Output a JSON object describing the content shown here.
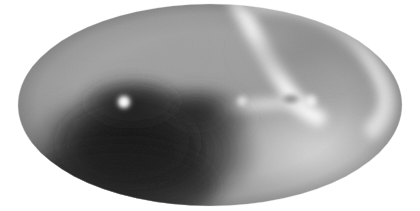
{
  "figure": {
    "name": "all-sky-map",
    "title": "",
    "background_color": "#ffffff",
    "width": 420,
    "height": 211,
    "colormap": "grayscale",
    "projection": "mollweide-ellipse"
  },
  "chart_data": {
    "type": "heatmap",
    "title": "",
    "subtitle": "",
    "xlabel": "",
    "ylabel": "",
    "legend": [],
    "annotations": [],
    "grid": false,
    "colorbar": false,
    "colormap": "grayscale",
    "colormap_stops": [
      {
        "value": 0.0,
        "hex": "#1f1f1f"
      },
      {
        "value": 0.2,
        "hex": "#3d3d3d"
      },
      {
        "value": 0.4,
        "hex": "#6e6e6e"
      },
      {
        "value": 0.6,
        "hex": "#9a9a9a"
      },
      {
        "value": 0.8,
        "hex": "#c6c6c6"
      },
      {
        "value": 1.0,
        "hex": "#f2f2f2"
      }
    ],
    "projection": {
      "shape": "ellipse",
      "center_x": 210,
      "center_y": 105,
      "radius_x": 192,
      "radius_y": 101
    },
    "xlim": [
      18,
      402
    ],
    "ylim": [
      4,
      206
    ],
    "features": [
      {
        "name": "dark-lobe-lower-left",
        "kind": "blob",
        "cx": 140,
        "cy": 150,
        "rx": 118,
        "ry": 72,
        "level": 0.06,
        "hex": "#262626"
      },
      {
        "name": "dark-lobe-core",
        "kind": "blob",
        "cx": 130,
        "cy": 142,
        "rx": 74,
        "ry": 48,
        "level": 0.02,
        "hex": "#1c1c1c"
      },
      {
        "name": "dark-ridge-center",
        "kind": "blob",
        "cx": 200,
        "cy": 118,
        "rx": 52,
        "ry": 34,
        "level": 0.1,
        "hex": "#2e2e2e"
      },
      {
        "name": "bright-arc-upper",
        "kind": "arc",
        "level": 0.95,
        "hex": "#f4f4f4"
      },
      {
        "name": "bright-arc-right",
        "kind": "arc",
        "level": 0.92,
        "hex": "#efefef"
      },
      {
        "name": "dark-bay-upper-right",
        "kind": "blob",
        "cx": 300,
        "cy": 52,
        "rx": 62,
        "ry": 34,
        "level": 0.45,
        "hex": "#8d8d8d"
      },
      {
        "name": "point-source-bright",
        "kind": "point",
        "cx": 124,
        "cy": 102,
        "r": 6,
        "level": 1.0,
        "hex": "#fbfbfb"
      },
      {
        "name": "point-source-small",
        "kind": "point",
        "cx": 242,
        "cy": 101,
        "r": 4,
        "level": 0.9,
        "hex": "#ededed"
      },
      {
        "name": "dark-ring-spot",
        "kind": "ring",
        "cx": 291,
        "cy": 99,
        "rx": 9,
        "ry": 5,
        "level": 0.38,
        "hex": "#777777"
      },
      {
        "name": "bright-knot-right",
        "kind": "point",
        "cx": 311,
        "cy": 101,
        "r": 6,
        "level": 0.93,
        "hex": "#f0f0f0"
      },
      {
        "name": "mid-gray-upper-left",
        "kind": "region",
        "cx": 110,
        "cy": 45,
        "level": 0.62,
        "hex": "#a9a9a9"
      },
      {
        "name": "mid-gray-lower-right",
        "kind": "region",
        "cx": 320,
        "cy": 160,
        "level": 0.66,
        "hex": "#b2b2b2"
      }
    ],
    "value_range": [
      0.0,
      1.0
    ],
    "x": [],
    "values": []
  }
}
